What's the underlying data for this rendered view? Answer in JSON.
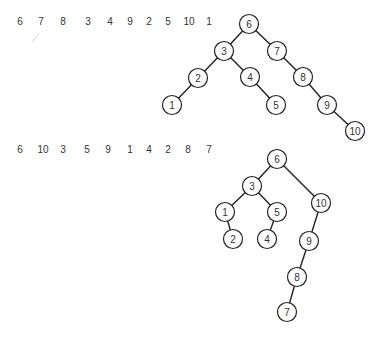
{
  "diagrams": [
    {
      "name": "bst-top",
      "insertion_sequence": [
        "6",
        "7",
        "8",
        "3",
        "4",
        "9",
        "2",
        "5",
        "10",
        "1"
      ],
      "sequence_x": [
        20,
        41,
        63,
        88,
        110,
        130,
        149,
        168,
        189,
        209
      ],
      "sequence_y": 21,
      "nodes": [
        {
          "label": "6",
          "x": 249,
          "y": 24
        },
        {
          "label": "3",
          "x": 224,
          "y": 51
        },
        {
          "label": "7",
          "x": 277,
          "y": 51
        },
        {
          "label": "2",
          "x": 198,
          "y": 78
        },
        {
          "label": "4",
          "x": 250,
          "y": 77
        },
        {
          "label": "8",
          "x": 303,
          "y": 77
        },
        {
          "label": "1",
          "x": 172,
          "y": 105
        },
        {
          "label": "5",
          "x": 276,
          "y": 105
        },
        {
          "label": "9",
          "x": 327,
          "y": 105
        },
        {
          "label": "10",
          "x": 355,
          "y": 131
        }
      ],
      "edges": [
        [
          "6",
          "3"
        ],
        [
          "6",
          "7"
        ],
        [
          "3",
          "2"
        ],
        [
          "3",
          "4"
        ],
        [
          "2",
          "1"
        ],
        [
          "4",
          "5"
        ],
        [
          "7",
          "8"
        ],
        [
          "8",
          "9"
        ],
        [
          "9",
          "10"
        ]
      ]
    },
    {
      "name": "bst-bottom",
      "insertion_sequence": [
        "6",
        "10",
        "3",
        "5",
        "9",
        "1",
        "4",
        "2",
        "8",
        "7"
      ],
      "sequence_x": [
        20,
        43,
        63,
        87,
        108,
        130,
        149,
        168,
        188,
        209
      ],
      "sequence_y": 149,
      "nodes": [
        {
          "label": "6",
          "x": 277,
          "y": 159
        },
        {
          "label": "3",
          "x": 252,
          "y": 186
        },
        {
          "label": "10",
          "x": 321,
          "y": 203
        },
        {
          "label": "1",
          "x": 225,
          "y": 212
        },
        {
          "label": "5",
          "x": 277,
          "y": 212
        },
        {
          "label": "2",
          "x": 233,
          "y": 239
        },
        {
          "label": "4",
          "x": 267,
          "y": 239
        },
        {
          "label": "9",
          "x": 309,
          "y": 241
        },
        {
          "label": "8",
          "x": 297,
          "y": 277
        },
        {
          "label": "7",
          "x": 287,
          "y": 312
        }
      ],
      "edges": [
        [
          "6",
          "3"
        ],
        [
          "6",
          "10"
        ],
        [
          "3",
          "1"
        ],
        [
          "3",
          "5"
        ],
        [
          "1",
          "2"
        ],
        [
          "5",
          "4"
        ],
        [
          "10",
          "9"
        ],
        [
          "9",
          "8"
        ],
        [
          "8",
          "7"
        ]
      ]
    }
  ],
  "node_radius": 9.5
}
